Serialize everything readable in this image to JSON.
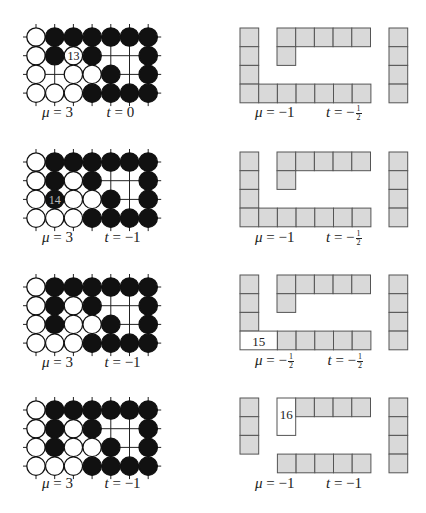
{
  "figure": {
    "rows": [
      {
        "go": {
          "stones": [
            "WBBBBBB",
            "WBWB..B",
            "W.WWB.B",
            "WWWBBBB"
          ],
          "labeled_stone": {
            "row": 1,
            "col": 2,
            "color": "W",
            "label": "13"
          },
          "mu": "3",
          "t": "0"
        },
        "tiles": {
          "labeled_tile": null,
          "mu": "−1",
          "t_sign": "−",
          "t_frac": {
            "num": "1",
            "den": "2"
          }
        }
      },
      {
        "go": {
          "stones": [
            "WBBBBBB",
            "WBWB..B",
            "WBWWB.B",
            "WWWBBBB"
          ],
          "labeled_stone": {
            "row": 2,
            "col": 1,
            "color": "B",
            "label": "14"
          },
          "mu": "3",
          "t": "−1"
        },
        "tiles": {
          "labeled_tile": null,
          "mu": "−1",
          "t_sign": "−",
          "t_frac": {
            "num": "1",
            "den": "2"
          }
        }
      },
      {
        "go": {
          "stones": [
            "WBBBBBB",
            "WBWB..B",
            "WBWWB.B",
            "WWWBBBB"
          ],
          "labeled_stone": null,
          "mu": "3",
          "t": "−1"
        },
        "tiles": {
          "labeled_tile": {
            "label": "15"
          },
          "mu_sign": "−",
          "mu_frac": {
            "num": "1",
            "den": "2"
          },
          "t_sign": "−",
          "t_frac": {
            "num": "1",
            "den": "2"
          }
        }
      },
      {
        "go": {
          "stones": [
            "WBBBBBB",
            "WBWB..B",
            "WBWWB.B",
            "WWWBBBB"
          ],
          "labeled_stone": null,
          "mu": "3",
          "t": "−1"
        },
        "tiles": {
          "labeled_tile": {
            "label": "16"
          },
          "mu": "−1",
          "t": "−1"
        }
      }
    ],
    "symbols": {
      "mu": "μ",
      "t": "t",
      "eq": " = "
    },
    "colors": {
      "tile_fill": "#d9d9d9",
      "tile_stroke": "#555555",
      "black_stone": "#111111",
      "white_stone": "#ffffff",
      "grid_line": "#222222"
    }
  }
}
